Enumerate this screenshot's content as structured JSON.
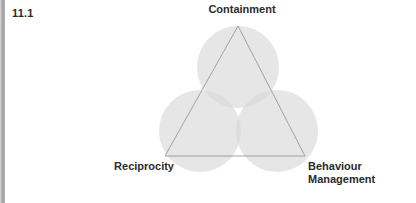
{
  "figure": {
    "number": "11.1"
  },
  "diagram": {
    "type": "venn-triangle",
    "labels": {
      "top": "Containment",
      "bottom_left": "Reciprocity",
      "bottom_right": "Behaviour\nManagement"
    },
    "colors": {
      "background": "#ffffff",
      "circle_fill": "#d6d6d6",
      "triangle_stroke": "#9a9a9a",
      "text": "#2b2b2b",
      "edge_bar": "#9e9e9e"
    },
    "geometry": {
      "circles": [
        {
          "name": "containment-circle",
          "cx": 238,
          "cy": 67,
          "r": 41
        },
        {
          "name": "reciprocity-circle",
          "cx": 200,
          "cy": 131,
          "r": 41
        },
        {
          "name": "behaviour-management-circle",
          "cx": 277,
          "cy": 131,
          "r": 41
        }
      ],
      "triangle": {
        "apex": [
          238,
          26
        ],
        "bottom_left": [
          165,
          156
        ],
        "bottom_right": [
          305,
          156
        ]
      }
    }
  }
}
